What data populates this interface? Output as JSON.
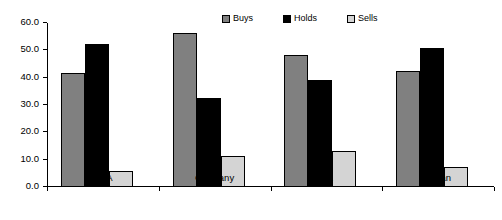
{
  "chart_data": {
    "type": "bar",
    "title": "",
    "subtitle": "",
    "xlabel": "",
    "ylabel": "",
    "categories": [
      "USA",
      "Germany",
      "UK",
      "Japan"
    ],
    "series": [
      {
        "name": "Buys",
        "color": "#808080",
        "values": [
          41.8,
          56.5,
          48.2,
          42.3
        ]
      },
      {
        "name": "Holds",
        "color": "#000000",
        "values": [
          52.5,
          32.6,
          39.2,
          50.8
        ]
      },
      {
        "name": "Sells",
        "color": "#d4d4d4",
        "values": [
          5.7,
          11.2,
          13.1,
          7.5
        ]
      }
    ],
    "ylim": [
      0.0,
      60.0
    ],
    "ytick_values": [
      0.0,
      10.0,
      20.0,
      30.0,
      40.0,
      50.0,
      60.0
    ],
    "ytick_labels": [
      "0.0",
      "10.0",
      "20.0",
      "30.0",
      "40.0",
      "50.0",
      "60.0"
    ],
    "grid": false,
    "legend_position": "top-right",
    "legend_entries": [
      "Buys",
      "Holds",
      "Sells"
    ]
  }
}
